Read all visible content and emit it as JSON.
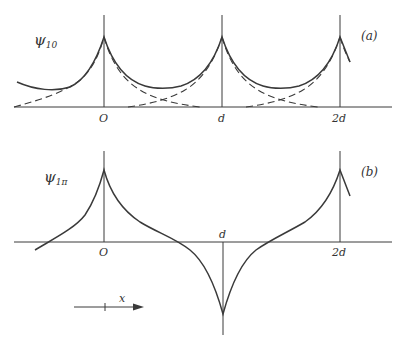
{
  "panels": [
    {
      "id": "a",
      "tag": "(a)",
      "ylabel_main": "ψ",
      "ylabel_sub": "10",
      "ticks": [
        "O",
        "d",
        "2d"
      ],
      "description": "Periodic wavefunction with cusps at lattice sites; dashed curves show individual exponential atomic contributions"
    },
    {
      "id": "b",
      "tag": "(b)",
      "ylabel_main": "ψ",
      "ylabel_sub": "1π",
      "ticks": [
        "O",
        "d",
        "2d"
      ],
      "description": "Alternating-sign wavefunction: positive cusp at O, negative cusp at d, positive cusp at 2d"
    }
  ],
  "direction_arrow": {
    "label": "x"
  },
  "colors": {
    "ink": "#3a3a3a",
    "background": "#ffffff"
  }
}
